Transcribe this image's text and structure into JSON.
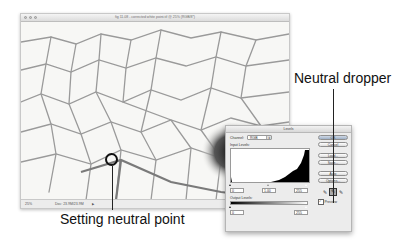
{
  "document_window": {
    "title": "fig 11.08 - corrected white point.tif @ 25% (RGB/8*)",
    "status": {
      "zoom": "25%",
      "doc_info": "Doc: 23.9M/23.9M",
      "menu_arrow": "▶"
    }
  },
  "levels_dialog": {
    "title": "Levels",
    "channel_label": "Channel:",
    "channel_value": "RGB",
    "input_levels_label": "Input Levels:",
    "input_levels": [
      "0",
      "1.00",
      "255"
    ],
    "output_levels_label": "Output Levels:",
    "output_levels": [
      "0",
      "255"
    ],
    "buttons": {
      "ok": "OK",
      "cancel": "Cancel",
      "load": "Load...",
      "save": "Save...",
      "auto": "Auto",
      "options": "Options..."
    },
    "droppers": {
      "black": "black-point-dropper",
      "gray": "gray-point-dropper",
      "white": "white-point-dropper",
      "active": "gray"
    },
    "preview_label": "Preview",
    "preview_checked": true
  },
  "callouts": {
    "neutral_dropper": "Neutral dropper",
    "setting_neutral_point": "Setting neutral point"
  }
}
